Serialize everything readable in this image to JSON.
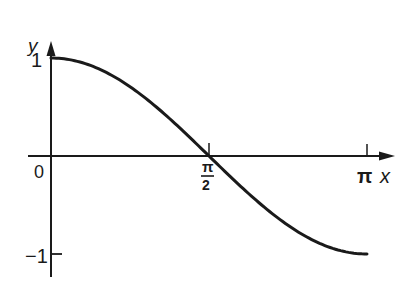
{
  "chart_data": {
    "type": "line",
    "title": "",
    "xlabel": "x",
    "ylabel": "y",
    "xlim": [
      0,
      3.14159
    ],
    "ylim": [
      -1,
      1
    ],
    "grid": false,
    "legend": null,
    "function": "y = cos(x)",
    "x_ticks": [
      {
        "value": 0,
        "label": "0"
      },
      {
        "value": 1.5708,
        "label": "π/2"
      },
      {
        "value": 3.14159,
        "label": "π"
      }
    ],
    "y_ticks": [
      {
        "value": 1,
        "label": "1"
      },
      {
        "value": -1,
        "label": "-1"
      }
    ],
    "series": [
      {
        "name": "cos x",
        "x": [
          0,
          0.3927,
          0.7854,
          1.1781,
          1.5708,
          1.9635,
          2.3562,
          2.7489,
          3.1416
        ],
        "values": [
          1,
          0.924,
          0.707,
          0.383,
          0,
          -0.383,
          -0.707,
          -0.924,
          -1
        ]
      }
    ]
  },
  "labels": {
    "y_axis": "y",
    "x_axis": "x",
    "origin": "0",
    "y_one": "1",
    "y_minus_one": "−1",
    "half_pi_num": "π",
    "half_pi_den": "2",
    "pi": "π"
  }
}
